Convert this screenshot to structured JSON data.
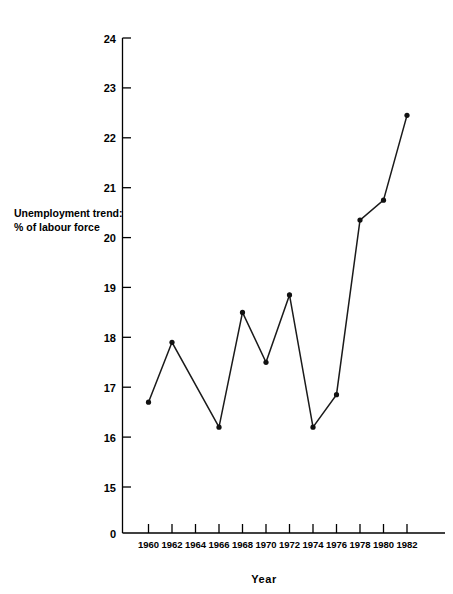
{
  "chart_data": {
    "type": "line",
    "title": "",
    "xlabel": "Year",
    "ylabel": "Unemployment trend: % of labour force",
    "ylabel_line1": "Unemployment trend:",
    "ylabel_line2": "% of labour force",
    "x": [
      1960,
      1962,
      1964,
      1966,
      1968,
      1970,
      1972,
      1974,
      1976,
      1978,
      1980,
      1982
    ],
    "values": [
      16.7,
      17.9,
      null,
      16.2,
      18.5,
      17.5,
      18.85,
      16.2,
      16.85,
      20.35,
      20.75,
      22.45
    ],
    "points": [
      {
        "x": 1960,
        "y": 16.7
      },
      {
        "x": 1962,
        "y": 17.9
      },
      {
        "x": 1966,
        "y": 16.2
      },
      {
        "x": 1968,
        "y": 18.5
      },
      {
        "x": 1970,
        "y": 17.5
      },
      {
        "x": 1972,
        "y": 18.85
      },
      {
        "x": 1974,
        "y": 16.2
      },
      {
        "x": 1976,
        "y": 16.85
      },
      {
        "x": 1978,
        "y": 20.35
      },
      {
        "x": 1980,
        "y": 20.75
      },
      {
        "x": 1982,
        "y": 22.45
      }
    ],
    "xticks": [
      "1960",
      "1962",
      "1964",
      "1966",
      "1968",
      "1970",
      "1972",
      "1974",
      "1976",
      "1978",
      "1980",
      "1982"
    ],
    "yticks": [
      "0",
      "15",
      "16",
      "17",
      "18",
      "19",
      "20",
      "21",
      "22",
      "23",
      "24"
    ],
    "ylim": [
      15,
      24
    ],
    "xlim": [
      1960,
      1982
    ],
    "y_axis_break": true,
    "y_zero_label": "0",
    "grid": false,
    "legend": "none",
    "series_color": "#111111",
    "marker": "circle",
    "background_color": "#ffffff"
  }
}
